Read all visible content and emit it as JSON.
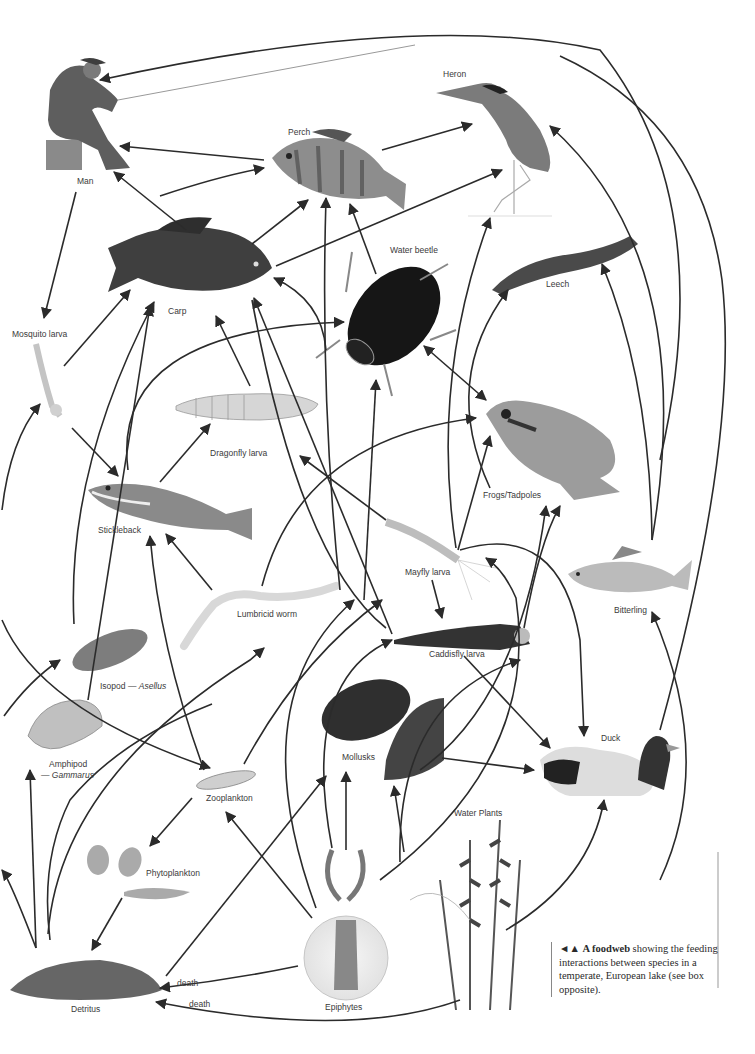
{
  "species": {
    "man": "Man",
    "heron": "Heron",
    "perch": "Perch",
    "carp": "Carp",
    "water_beetle": "Water beetle",
    "leech": "Leech",
    "mosquito_larva": "Mosquito larva",
    "dragonfly_larva": "Dragonfly larva",
    "frogs": "Frogs/Tadpoles",
    "stickleback": "Stickleback",
    "mayfly_larva": "Mayfly larva",
    "bitterling": "Bitterling",
    "lumbricid_worm": "Lumbricid worm",
    "caddisfly_larva": "Caddisfly larva",
    "isopod": "Isopod — ",
    "isopod_genus": "Asellus",
    "amphipod": "Amphipod",
    "amphipod_genus": "— Gammarus",
    "mollusks": "Mollusks",
    "duck": "Duck",
    "zooplankton": "Zooplankton",
    "water_plants": "Water Plants",
    "phytoplankton": "Phytoplankton",
    "detritus": "Detritus",
    "epiphytes": "Epiphytes"
  },
  "edge_labels": {
    "death_1": "death",
    "death_2": "death"
  },
  "caption": {
    "marker": "◄▲",
    "bold": "A foodweb",
    "text": " showing the feeding interactions between species in a temperate, European lake (see box opposite)."
  },
  "colors": {
    "ink": "#2b2b2b",
    "background": "#ffffff",
    "label": "#3a3a3a"
  }
}
